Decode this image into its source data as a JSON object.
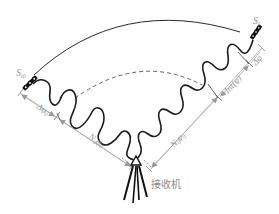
{
  "diagram": {
    "type": "GNSS carrier phase measurement schematic",
    "satellite_t0": {
      "label": "S",
      "subscript": "t0"
    },
    "satellite_t": {
      "label": "S",
      "subscript": "t"
    },
    "receiver_label": "接收机",
    "segments": {
      "delta_phi_0": "Δφ",
      "delta_phi_0_sub": "0",
      "n_phi_0_left": "N",
      "n_phi_0_left_sub": "0",
      "n_phi_0_left_phi": "φ",
      "n_phi_0_left_phi_sub": "0",
      "n_phi_0_right": "N",
      "n_phi_0_right_sub": "0",
      "n_phi_0_right_phi": "φ",
      "n_phi_0_right_phi_sub": "0",
      "int_phi": "Int(φ)",
      "delta_phi": "Δφ"
    },
    "colors": {
      "wave": "#1a1a1a",
      "orbit_arc": "#2a2a2a",
      "dashed_arc": "#4a4a4a",
      "dimension_line": "#a0a0a0",
      "label": "#9a9a9a",
      "satellite": "#111111"
    }
  }
}
